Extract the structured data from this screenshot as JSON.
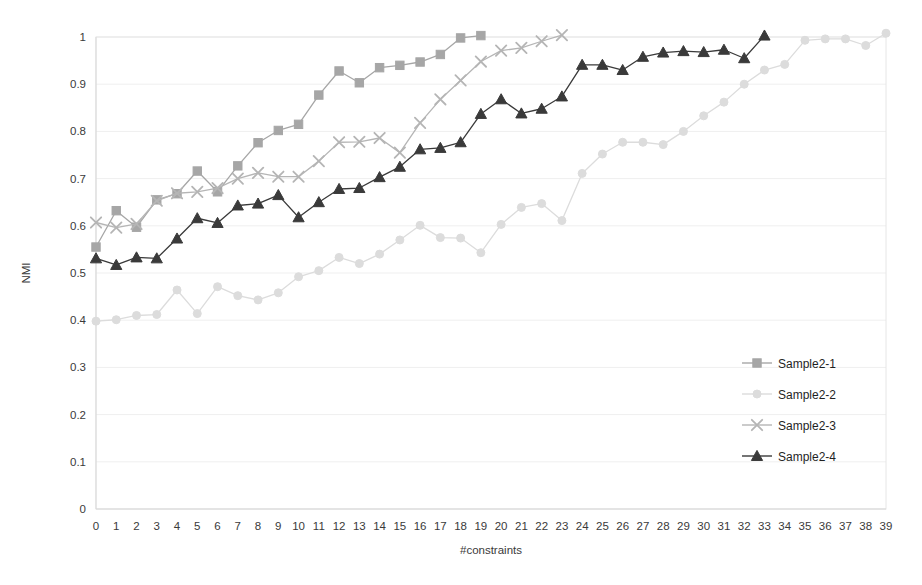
{
  "chart_data": {
    "type": "line",
    "title": "",
    "xlabel": "#constraints",
    "ylabel": "NMI",
    "xlim": [
      0,
      39
    ],
    "ylim": [
      0,
      1
    ],
    "grid": true,
    "legend_position": "right",
    "x": [
      0,
      1,
      2,
      3,
      4,
      5,
      6,
      7,
      8,
      9,
      10,
      11,
      12,
      13,
      14,
      15,
      16,
      17,
      18,
      19,
      20,
      21,
      22,
      23,
      24,
      25,
      26,
      27,
      28,
      29,
      30,
      31,
      32,
      33,
      34,
      35,
      36,
      37,
      38,
      39
    ],
    "xtick_labels": [
      "0",
      "1",
      "2",
      "3",
      "4",
      "5",
      "6",
      "7",
      "8",
      "9",
      "10",
      "11",
      "12",
      "13",
      "14",
      "15",
      "16",
      "17",
      "18",
      "19",
      "20",
      "21",
      "22",
      "23",
      "24",
      "25",
      "26",
      "27",
      "28",
      "29",
      "30",
      "31",
      "32",
      "33",
      "34",
      "35",
      "36",
      "37",
      "38",
      "39"
    ],
    "ytick_labels": [
      "0",
      "0.1",
      "0.2",
      "0.3",
      "0.4",
      "0.5",
      "0.6",
      "0.7",
      "0.8",
      "0.9",
      "1"
    ],
    "ytick_values": [
      0,
      0.1,
      0.2,
      0.3,
      0.4,
      0.5,
      0.6,
      0.7,
      0.8,
      0.9,
      1
    ],
    "series": [
      {
        "name": "Sample2-1",
        "marker": "square",
        "color": "#a6a6a6",
        "x": [
          0,
          1,
          2,
          3,
          4,
          5,
          6,
          7,
          8,
          9,
          10,
          11,
          12,
          13,
          14,
          15,
          16,
          17,
          18,
          19
        ],
        "values": [
          0.555,
          0.632,
          0.597,
          0.655,
          0.668,
          0.716,
          0.672,
          0.727,
          0.776,
          0.802,
          0.815,
          0.877,
          0.928,
          0.903,
          0.935,
          0.94,
          0.947,
          0.963,
          0.998,
          1.003
        ]
      },
      {
        "name": "Sample2-2",
        "marker": "circle",
        "color": "#dcdcdc",
        "x": [
          0,
          1,
          2,
          3,
          4,
          5,
          6,
          7,
          8,
          9,
          10,
          11,
          12,
          13,
          14,
          15,
          16,
          17,
          18,
          19,
          20,
          21,
          22,
          23,
          24,
          25,
          26,
          27,
          28,
          29,
          30,
          31,
          32,
          33,
          34,
          35,
          36,
          37,
          38,
          39
        ],
        "values": [
          0.398,
          0.401,
          0.41,
          0.412,
          0.464,
          0.414,
          0.471,
          0.452,
          0.443,
          0.458,
          0.492,
          0.505,
          0.533,
          0.52,
          0.54,
          0.57,
          0.601,
          0.575,
          0.574,
          0.543,
          0.603,
          0.639,
          0.647,
          0.611,
          0.711,
          0.752,
          0.777,
          0.777,
          0.772,
          0.8,
          0.833,
          0.862,
          0.9,
          0.93,
          0.942,
          0.993,
          0.996,
          0.996,
          0.982,
          1.008
        ]
      },
      {
        "name": "Sample2-3",
        "marker": "x",
        "color": "#b5b5b5",
        "x": [
          0,
          1,
          2,
          3,
          4,
          5,
          6,
          7,
          8,
          9,
          10,
          11,
          12,
          13,
          14,
          15,
          16,
          17,
          18,
          19,
          20,
          21,
          22,
          23
        ],
        "values": [
          0.607,
          0.596,
          0.604,
          0.653,
          0.669,
          0.672,
          0.68,
          0.7,
          0.712,
          0.704,
          0.704,
          0.737,
          0.777,
          0.778,
          0.786,
          0.755,
          0.818,
          0.868,
          0.908,
          0.948,
          0.971,
          0.977,
          0.991,
          1.004
        ]
      },
      {
        "name": "Sample2-4",
        "marker": "triangle",
        "color": "#3a3a3a",
        "x": [
          0,
          1,
          2,
          3,
          4,
          5,
          6,
          7,
          8,
          9,
          10,
          11,
          12,
          13,
          14,
          15,
          16,
          17,
          18,
          19,
          20,
          21,
          22,
          23,
          24,
          25,
          26,
          27,
          28,
          29,
          30,
          31,
          32,
          33
        ],
        "values": [
          0.531,
          0.517,
          0.533,
          0.531,
          0.573,
          0.616,
          0.606,
          0.643,
          0.647,
          0.665,
          0.618,
          0.65,
          0.678,
          0.68,
          0.703,
          0.725,
          0.762,
          0.765,
          0.777,
          0.837,
          0.868,
          0.838,
          0.848,
          0.874,
          0.941,
          0.941,
          0.93,
          0.958,
          0.967,
          0.97,
          0.968,
          0.973,
          0.955,
          1.003
        ]
      }
    ]
  },
  "legend": {
    "items": [
      {
        "label": "Sample2-1"
      },
      {
        "label": "Sample2-2"
      },
      {
        "label": "Sample2-3"
      },
      {
        "label": "Sample2-4"
      }
    ]
  }
}
